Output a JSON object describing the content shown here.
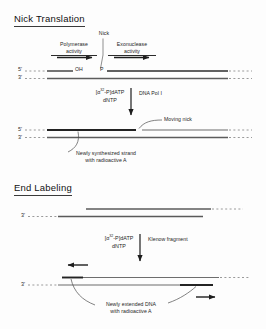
{
  "figure": {
    "sections": [
      {
        "id": "nick-translation",
        "title": "Nick Translation",
        "before": {
          "five_prime": "5'",
          "three_prime": "3'",
          "nick_label": "Nick",
          "ohs": "OH",
          "phosphate": "P",
          "left_activity_line1": "Polymerase",
          "left_activity_line2": "activity",
          "right_activity_line1": "Exonuclease",
          "right_activity_line2": "activity"
        },
        "reaction": {
          "substrate_bracket_open": "[",
          "substrate_alpha": "α",
          "substrate_sup": "32",
          "substrate_rest": "-P]dATP",
          "substrate_line2": "dNTP",
          "enzyme": "DNA Pol I"
        },
        "after": {
          "five_prime": "5'",
          "three_prime": "3'",
          "callout_right": "Moving nick",
          "callout_left_line1": "Newly synthesized strand",
          "callout_left_line2": "with radioactive A"
        }
      },
      {
        "id": "end-labeling",
        "title": "End Labeling",
        "before": {
          "three_prime": "3'"
        },
        "reaction": {
          "substrate_bracket_open": "[",
          "substrate_alpha": "α",
          "substrate_sup": "32",
          "substrate_rest": "-P]dATP",
          "substrate_line2": "dNTP",
          "enzyme": "Klenow fragment"
        },
        "after": {
          "three_prime": "3'",
          "callout_line1": "Newly extended DNA",
          "callout_line2": "with radioactive A"
        }
      }
    ],
    "colors": {
      "ink": "#1d1d1d",
      "strand_dark": "#2b2b2b",
      "strand_gray": "#6d6d6d",
      "dotted": "#9a9a9a",
      "background": "#fdfdfd"
    }
  }
}
